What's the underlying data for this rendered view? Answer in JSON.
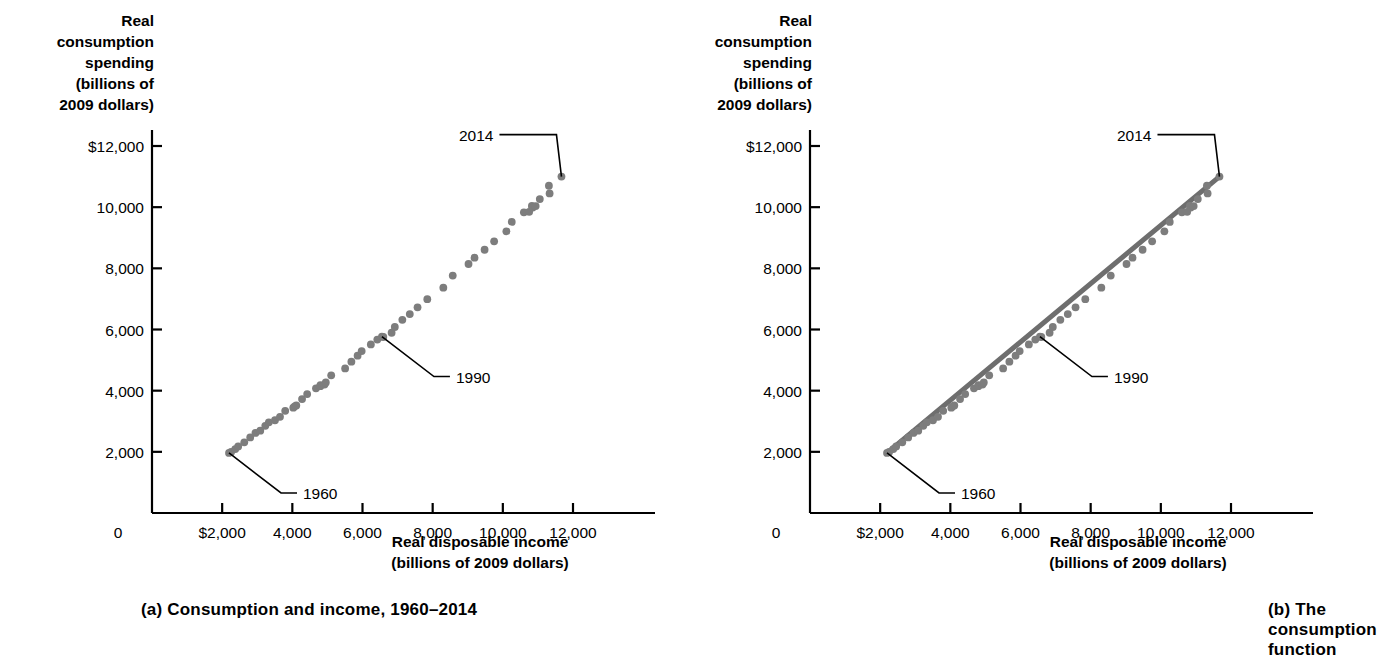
{
  "figure": {
    "panels": [
      {
        "id": "a",
        "caption": "(a) Consumption and income, 1960–2014",
        "ylabel": "Real\nconsumption\nspending\n(billions of\n2009 dollars)",
        "xlabel": "Real disposable income\n(billions of 2009 dollars)",
        "yticks": [
          "$12,000",
          "10,000",
          "8,000",
          "6,000",
          "4,000",
          "2,000"
        ],
        "xticks": [
          "0",
          "$2,000",
          "4,000",
          "6,000",
          "8,000",
          "10,000",
          "12,000"
        ],
        "annotations": [
          {
            "label": "2014"
          },
          {
            "label": "1990"
          },
          {
            "label": "1960"
          }
        ]
      },
      {
        "id": "b",
        "caption": "(b) The consumption function",
        "ylabel": "Real\nconsumption\nspending\n(billions of\n2009 dollars)",
        "xlabel": "Real disposable income\n(billions of 2009 dollars)",
        "yticks": [
          "$12,000",
          "10,000",
          "8,000",
          "6,000",
          "4,000",
          "2,000"
        ],
        "xticks": [
          "0",
          "$2,000",
          "4,000",
          "6,000",
          "8,000",
          "10,000",
          "12,000"
        ],
        "annotations": [
          {
            "label": "2014"
          },
          {
            "label": "1990"
          },
          {
            "label": "1960"
          }
        ]
      }
    ]
  },
  "colors": {
    "marker": "#7d7d7d",
    "line": "#6e6e6e",
    "axis": "#000000",
    "text": "#000000",
    "background": "#ffffff"
  },
  "chart_data": [
    {
      "type": "scatter",
      "title": "(a) Consumption and income, 1960–2014",
      "xlabel": "Real disposable income (billions of 2009 dollars)",
      "ylabel": "Real consumption spending (billions of 2009 dollars)",
      "xlim": [
        0,
        12800
      ],
      "ylim": [
        0,
        12800
      ],
      "xticks": [
        0,
        2000,
        4000,
        6000,
        8000,
        10000,
        12000
      ],
      "yticks": [
        2000,
        4000,
        6000,
        8000,
        10000,
        12000
      ],
      "grid": false,
      "legend": null,
      "series": [
        {
          "name": "Consumption vs disposable income, 1960–2014",
          "points": [
            {
              "year": 1960,
              "x": 2195,
              "y": 1964
            },
            {
              "year": 1961,
              "x": 2255,
              "y": 1998
            },
            {
              "year": 1962,
              "x": 2373,
              "y": 2090
            },
            {
              "year": 1963,
              "x": 2456,
              "y": 2177
            },
            {
              "year": 1964,
              "x": 2630,
              "y": 2311
            },
            {
              "year": 1965,
              "x": 2799,
              "y": 2470
            },
            {
              "year": 1966,
              "x": 2949,
              "y": 2617
            },
            {
              "year": 1967,
              "x": 3086,
              "y": 2692
            },
            {
              "year": 1968,
              "x": 3229,
              "y": 2849
            },
            {
              "year": 1969,
              "x": 3330,
              "y": 2965
            },
            {
              "year": 1970,
              "x": 3505,
              "y": 3033
            },
            {
              "year": 1971,
              "x": 3648,
              "y": 3146
            },
            {
              "year": 1972,
              "x": 3797,
              "y": 3341
            },
            {
              "year": 1973,
              "x": 4068,
              "y": 3488
            },
            {
              "year": 1974,
              "x": 4027,
              "y": 3444
            },
            {
              "year": 1975,
              "x": 4113,
              "y": 3518
            },
            {
              "year": 1976,
              "x": 4277,
              "y": 3724
            },
            {
              "year": 1977,
              "x": 4423,
              "y": 3890
            },
            {
              "year": 1978,
              "x": 4674,
              "y": 4075
            },
            {
              "year": 1979,
              "x": 4800,
              "y": 4178
            },
            {
              "year": 1980,
              "x": 4797,
              "y": 4147
            },
            {
              "year": 1981,
              "x": 4916,
              "y": 4198
            },
            {
              "year": 1982,
              "x": 4954,
              "y": 4268
            },
            {
              "year": 1983,
              "x": 5108,
              "y": 4502
            },
            {
              "year": 1984,
              "x": 5505,
              "y": 4728
            },
            {
              "year": 1985,
              "x": 5683,
              "y": 4948
            },
            {
              "year": 1986,
              "x": 5860,
              "y": 5145
            },
            {
              "year": 1987,
              "x": 5976,
              "y": 5295
            },
            {
              "year": 1988,
              "x": 6238,
              "y": 5512
            },
            {
              "year": 1989,
              "x": 6422,
              "y": 5672
            },
            {
              "year": 1990,
              "x": 6554,
              "y": 5769
            },
            {
              "year": 1991,
              "x": 6593,
              "y": 5755
            },
            {
              "year": 1992,
              "x": 6830,
              "y": 5894
            },
            {
              "year": 1993,
              "x": 6921,
              "y": 6082
            },
            {
              "year": 1994,
              "x": 7136,
              "y": 6315
            },
            {
              "year": 1995,
              "x": 7348,
              "y": 6504
            },
            {
              "year": 1996,
              "x": 7569,
              "y": 6726
            },
            {
              "year": 1997,
              "x": 7847,
              "y": 6991
            },
            {
              "year": 1998,
              "x": 8304,
              "y": 7367
            },
            {
              "year": 1999,
              "x": 8572,
              "y": 7763
            },
            {
              "year": 2000,
              "x": 9022,
              "y": 8141
            },
            {
              "year": 2001,
              "x": 9193,
              "y": 8347
            },
            {
              "year": 2002,
              "x": 9480,
              "y": 8607
            },
            {
              "year": 2003,
              "x": 9752,
              "y": 8884
            },
            {
              "year": 2004,
              "x": 10101,
              "y": 9211
            },
            {
              "year": 2005,
              "x": 10254,
              "y": 9519
            },
            {
              "year": 2006,
              "x": 10600,
              "y": 9831
            },
            {
              "year": 2007,
              "x": 10828,
              "y": 10042
            },
            {
              "year": 2008,
              "x": 10851,
              "y": 9988
            },
            {
              "year": 2009,
              "x": 10751,
              "y": 9847
            },
            {
              "year": 2010,
              "x": 10936,
              "y": 10036
            },
            {
              "year": 2011,
              "x": 11054,
              "y": 10263
            },
            {
              "year": 2012,
              "x": 11333,
              "y": 10450
            },
            {
              "year": 2013,
              "x": 11313,
              "y": 10700
            },
            {
              "year": 2014,
              "x": 11671,
              "y": 11000
            }
          ]
        }
      ],
      "annotations": [
        {
          "label": "2014",
          "point_year": 2014
        },
        {
          "label": "1990",
          "point_year": 1990
        },
        {
          "label": "1960",
          "point_year": 1960
        }
      ]
    },
    {
      "type": "scatter",
      "title": "(b) The consumption function",
      "xlabel": "Real disposable income (billions of 2009 dollars)",
      "ylabel": "Real consumption spending (billions of 2009 dollars)",
      "xlim": [
        0,
        12800
      ],
      "ylim": [
        0,
        12800
      ],
      "xticks": [
        0,
        2000,
        4000,
        6000,
        8000,
        10000,
        12000
      ],
      "yticks": [
        2000,
        4000,
        6000,
        8000,
        10000,
        12000
      ],
      "grid": false,
      "legend": null,
      "trendline": {
        "name": "Consumption function",
        "x_start": 2195,
        "y_start": 1964,
        "x_end": 11671,
        "y_end": 11000
      },
      "series": [
        {
          "name": "Consumption vs disposable income, 1960–2014",
          "points": [
            {
              "year": 1960,
              "x": 2195,
              "y": 1964
            },
            {
              "year": 1961,
              "x": 2255,
              "y": 1998
            },
            {
              "year": 1962,
              "x": 2373,
              "y": 2090
            },
            {
              "year": 1963,
              "x": 2456,
              "y": 2177
            },
            {
              "year": 1964,
              "x": 2630,
              "y": 2311
            },
            {
              "year": 1965,
              "x": 2799,
              "y": 2470
            },
            {
              "year": 1966,
              "x": 2949,
              "y": 2617
            },
            {
              "year": 1967,
              "x": 3086,
              "y": 2692
            },
            {
              "year": 1968,
              "x": 3229,
              "y": 2849
            },
            {
              "year": 1969,
              "x": 3330,
              "y": 2965
            },
            {
              "year": 1970,
              "x": 3505,
              "y": 3033
            },
            {
              "year": 1971,
              "x": 3648,
              "y": 3146
            },
            {
              "year": 1972,
              "x": 3797,
              "y": 3341
            },
            {
              "year": 1973,
              "x": 4068,
              "y": 3488
            },
            {
              "year": 1974,
              "x": 4027,
              "y": 3444
            },
            {
              "year": 1975,
              "x": 4113,
              "y": 3518
            },
            {
              "year": 1976,
              "x": 4277,
              "y": 3724
            },
            {
              "year": 1977,
              "x": 4423,
              "y": 3890
            },
            {
              "year": 1978,
              "x": 4674,
              "y": 4075
            },
            {
              "year": 1979,
              "x": 4800,
              "y": 4178
            },
            {
              "year": 1980,
              "x": 4797,
              "y": 4147
            },
            {
              "year": 1981,
              "x": 4916,
              "y": 4198
            },
            {
              "year": 1982,
              "x": 4954,
              "y": 4268
            },
            {
              "year": 1983,
              "x": 5108,
              "y": 4502
            },
            {
              "year": 1984,
              "x": 5505,
              "y": 4728
            },
            {
              "year": 1985,
              "x": 5683,
              "y": 4948
            },
            {
              "year": 1986,
              "x": 5860,
              "y": 5145
            },
            {
              "year": 1987,
              "x": 5976,
              "y": 5295
            },
            {
              "year": 1988,
              "x": 6238,
              "y": 5512
            },
            {
              "year": 1989,
              "x": 6422,
              "y": 5672
            },
            {
              "year": 1990,
              "x": 6554,
              "y": 5769
            },
            {
              "year": 1991,
              "x": 6593,
              "y": 5755
            },
            {
              "year": 1992,
              "x": 6830,
              "y": 5894
            },
            {
              "year": 1993,
              "x": 6921,
              "y": 6082
            },
            {
              "year": 1994,
              "x": 7136,
              "y": 6315
            },
            {
              "year": 1995,
              "x": 7348,
              "y": 6504
            },
            {
              "year": 1996,
              "x": 7569,
              "y": 6726
            },
            {
              "year": 1997,
              "x": 7847,
              "y": 6991
            },
            {
              "year": 1998,
              "x": 8304,
              "y": 7367
            },
            {
              "year": 1999,
              "x": 8572,
              "y": 7763
            },
            {
              "year": 2000,
              "x": 9022,
              "y": 8141
            },
            {
              "year": 2001,
              "x": 9193,
              "y": 8347
            },
            {
              "year": 2002,
              "x": 9480,
              "y": 8607
            },
            {
              "year": 2003,
              "x": 9752,
              "y": 8884
            },
            {
              "year": 2004,
              "x": 10101,
              "y": 9211
            },
            {
              "year": 2005,
              "x": 10254,
              "y": 9519
            },
            {
              "year": 2006,
              "x": 10600,
              "y": 9831
            },
            {
              "year": 2007,
              "x": 10828,
              "y": 10042
            },
            {
              "year": 2008,
              "x": 10851,
              "y": 9988
            },
            {
              "year": 2009,
              "x": 10751,
              "y": 9847
            },
            {
              "year": 2010,
              "x": 10936,
              "y": 10036
            },
            {
              "year": 2011,
              "x": 11054,
              "y": 10263
            },
            {
              "year": 2012,
              "x": 11333,
              "y": 10450
            },
            {
              "year": 2013,
              "x": 11313,
              "y": 10700
            },
            {
              "year": 2014,
              "x": 11671,
              "y": 11000
            }
          ]
        }
      ],
      "annotations": [
        {
          "label": "2014",
          "point_year": 2014
        },
        {
          "label": "1990",
          "point_year": 1990
        },
        {
          "label": "1960",
          "point_year": 1960
        }
      ]
    }
  ]
}
